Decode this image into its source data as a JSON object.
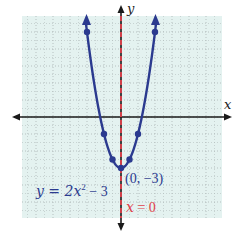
{
  "chart_data": {
    "type": "line",
    "title": "",
    "xlabel": "x",
    "ylabel": "y",
    "xlim": [
      -6,
      6
    ],
    "ylim": [
      -6,
      6
    ],
    "grid": true,
    "series": [
      {
        "name": "y = 2x^2 - 3",
        "equation": "y = 2x^2 - 3",
        "color": "#2b3a8f",
        "points": [
          {
            "x": -2,
            "y": 5
          },
          {
            "x": -1,
            "y": -1
          },
          {
            "x": -0.5,
            "y": -2.5
          },
          {
            "x": 0,
            "y": -3
          },
          {
            "x": 0.5,
            "y": -2.5
          },
          {
            "x": 1,
            "y": -1
          },
          {
            "x": 2,
            "y": 5
          }
        ]
      },
      {
        "name": "axis of symmetry",
        "equation": "x = 0",
        "color": "#e0404a",
        "style": "dashed"
      }
    ],
    "annotations": [
      {
        "text": "(0, −3)",
        "x": 0,
        "y": -3,
        "note": "vertex"
      },
      {
        "text": "x = 0",
        "note": "axis of symmetry label"
      },
      {
        "text": "y = 2x² − 3",
        "note": "curve label"
      }
    ]
  },
  "labels": {
    "x_axis": "x",
    "y_axis": "y",
    "curve_equation_prefix": "y = 2x",
    "curve_equation_exp": "2",
    "curve_equation_suffix": " − 3",
    "vertex": "(0, −3)",
    "symmetry_var": "x",
    "symmetry_rest": " = 0"
  },
  "colors": {
    "background": "#e4f2f0",
    "grid": "#aab4b4",
    "curve": "#2b3a8f",
    "symmetry": "#e0404a",
    "axis": "#1a1a1a"
  }
}
